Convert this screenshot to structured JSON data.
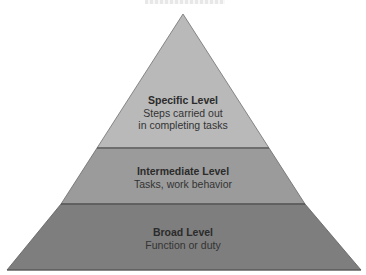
{
  "diagram": {
    "type": "pyramid",
    "orientation": "apex-up",
    "levels": [
      {
        "position": "top",
        "title": "Specific Level",
        "description_lines": [
          "Steps carried out",
          "in completing tasks"
        ],
        "fill": "#b9b9b9"
      },
      {
        "position": "middle",
        "title": "Intermediate Level",
        "description_lines": [
          "Tasks, work behavior"
        ],
        "fill": "#9b9b9b"
      },
      {
        "position": "bottom",
        "title": "Broad Level",
        "description_lines": [
          "Function or duty"
        ],
        "fill": "#7e7e7e"
      }
    ],
    "separator_color": "#555555",
    "edge_color": "#6a6a6a"
  }
}
